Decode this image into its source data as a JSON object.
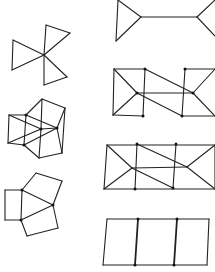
{
  "figure": {
    "type": "graph-drawings",
    "colors": {
      "background": "#ffffff",
      "stroke": "#222222",
      "vertex": "#111111"
    },
    "graphs": [
      {
        "id": "pinwheel",
        "name": "Three triangles sharing a central vertex",
        "edges": [
          [
            44,
            55,
            46,
            25
          ],
          [
            46,
            25,
            70,
            33
          ],
          [
            70,
            33,
            44,
            55
          ],
          [
            44,
            55,
            13,
            40
          ],
          [
            13,
            40,
            12,
            70
          ],
          [
            12,
            70,
            44,
            55
          ],
          [
            44,
            55,
            44,
            85
          ],
          [
            44,
            85,
            67,
            77
          ],
          [
            67,
            77,
            44,
            55
          ]
        ],
        "vertices": []
      },
      {
        "id": "folded-cube",
        "name": "Overlapping quadrilaterals with triangular flaps",
        "edges": [
          [
            42,
            99,
            65,
            108
          ],
          [
            42,
            99,
            26,
            115
          ],
          [
            42,
            99,
            41,
            129
          ],
          [
            65,
            108,
            57,
            128
          ],
          [
            65,
            108,
            62,
            153
          ],
          [
            9,
            115,
            26,
            115
          ],
          [
            9,
            115,
            8,
            143
          ],
          [
            9,
            115,
            41,
            129
          ],
          [
            26,
            115,
            57,
            128
          ],
          [
            26,
            115,
            24,
            145
          ],
          [
            41,
            129,
            57,
            128
          ],
          [
            41,
            129,
            8,
            143
          ],
          [
            41,
            129,
            39,
            158
          ],
          [
            57,
            128,
            24,
            145
          ],
          [
            57,
            128,
            62,
            153
          ],
          [
            8,
            143,
            24,
            145
          ],
          [
            24,
            145,
            39,
            158
          ],
          [
            39,
            158,
            62,
            153
          ]
        ],
        "vertices": [
          [
            26,
            115
          ],
          [
            57,
            128
          ],
          [
            24,
            145
          ],
          [
            41,
            129
          ]
        ]
      },
      {
        "id": "three-pentagons",
        "name": "Square and two pentagons around a central triangle",
        "edges": [
          [
            5,
            190,
            22,
            190
          ],
          [
            5,
            190,
            5,
            220
          ],
          [
            5,
            220,
            21,
            220
          ],
          [
            22,
            190,
            21,
            220
          ],
          [
            22,
            190,
            53,
            205
          ],
          [
            21,
            220,
            53,
            205
          ],
          [
            22,
            190,
            36,
            173
          ],
          [
            36,
            173,
            62,
            181
          ],
          [
            62,
            181,
            53,
            205
          ],
          [
            21,
            220,
            27,
            236
          ],
          [
            27,
            236,
            58,
            228
          ],
          [
            58,
            228,
            53,
            205
          ]
        ],
        "vertices": [
          [
            22,
            190
          ],
          [
            21,
            220
          ],
          [
            53,
            205
          ]
        ]
      },
      {
        "id": "barbell",
        "name": "Two triangles joined by a bridge edge",
        "edges": [
          [
            118,
            0,
            141,
            17
          ],
          [
            141,
            17,
            116,
            41
          ],
          [
            116,
            41,
            118,
            0
          ],
          [
            141,
            17,
            197,
            17
          ],
          [
            197,
            17,
            215,
            0
          ],
          [
            197,
            17,
            215,
            36
          ]
        ],
        "vertices": []
      },
      {
        "id": "z-graph",
        "name": "Rectangle with Z-shaped crossing diagonals",
        "edges": [
          [
            114,
            69,
            145,
            69
          ],
          [
            185,
            69,
            215,
            69
          ],
          [
            113,
            115,
            143,
            116
          ],
          [
            182,
            116,
            215,
            116
          ],
          [
            114,
            69,
            113,
            115
          ],
          [
            145,
            69,
            143,
            116
          ],
          [
            185,
            69,
            182,
            116
          ],
          [
            114,
            69,
            137,
            93
          ],
          [
            113,
            115,
            137,
            93
          ],
          [
            137,
            93,
            193,
            93
          ],
          [
            145,
            69,
            193,
            93
          ],
          [
            137,
            93,
            182,
            116
          ],
          [
            193,
            93,
            215,
            69
          ],
          [
            193,
            93,
            215,
            116
          ]
        ],
        "vertices": [
          [
            145,
            69
          ],
          [
            185,
            69
          ],
          [
            143,
            116
          ],
          [
            182,
            116
          ],
          [
            137,
            93
          ],
          [
            193,
            93
          ]
        ]
      },
      {
        "id": "closed-z-graph",
        "name": "Closed rectangle with crossing diagonals",
        "edges": [
          [
            107,
            145,
            215,
            145
          ],
          [
            104,
            189,
            215,
            189
          ],
          [
            107,
            145,
            104,
            189
          ],
          [
            215,
            145,
            215,
            189
          ],
          [
            137,
            144,
            135,
            189
          ],
          [
            176,
            144,
            173,
            188
          ],
          [
            107,
            145,
            132,
            168
          ],
          [
            104,
            189,
            132,
            168
          ],
          [
            132,
            168,
            187,
            167
          ],
          [
            137,
            144,
            187,
            167
          ],
          [
            132,
            168,
            173,
            188
          ],
          [
            187,
            167,
            215,
            145
          ],
          [
            187,
            167,
            215,
            189
          ]
        ],
        "vertices": [
          [
            137,
            144
          ],
          [
            176,
            144
          ],
          [
            135,
            189
          ],
          [
            173,
            188
          ]
        ]
      },
      {
        "id": "ladder",
        "name": "Three-cell ladder",
        "edges": [
          [
            107,
            219,
            209,
            219
          ],
          [
            103,
            265,
            207,
            265
          ],
          [
            107,
            219,
            103,
            265
          ],
          [
            209,
            219,
            207,
            265
          ]
        ],
        "thick_edges": [
          [
            138,
            219,
            135,
            265
          ],
          [
            177,
            219,
            174,
            265
          ]
        ],
        "vertices": [
          [
            138,
            219
          ],
          [
            177,
            219
          ],
          [
            135,
            265
          ],
          [
            174,
            265
          ]
        ]
      }
    ]
  }
}
